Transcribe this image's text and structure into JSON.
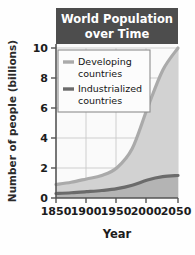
{
  "chart_data": {
    "type": "area",
    "title_line1": "World  Population",
    "title_line2": "over Time",
    "xlabel": "Year",
    "ylabel": "Number of people (billions)",
    "xlim": [
      1850,
      2050
    ],
    "ylim": [
      0,
      10
    ],
    "xticks": [
      "1850",
      "1900",
      "1950",
      "2000",
      "2050"
    ],
    "xtick_values": [
      1850,
      1900,
      1950,
      2000,
      2050
    ],
    "yticks": [
      "0",
      "2",
      "4",
      "6",
      "8",
      "10"
    ],
    "ytick_values": [
      0,
      2,
      4,
      6,
      8,
      10
    ],
    "grid": true,
    "stacked": true,
    "legend_position": "upper-left",
    "x": [
      1850,
      1875,
      1900,
      1925,
      1950,
      1975,
      2000,
      2025,
      2050
    ],
    "series": [
      {
        "name": "Industrialized countries",
        "legend_label_line1": "Industrialized",
        "legend_label_line2": "countries",
        "color": "#6b6b6b",
        "fill": "#b4b4b4",
        "values": [
          0.3,
          0.35,
          0.42,
          0.5,
          0.62,
          0.85,
          1.2,
          1.42,
          1.5
        ]
      },
      {
        "name": "Developing countries",
        "legend_label_line1": "Developing",
        "legend_label_line2": "countries",
        "color": "#aaaaaa",
        "fill": "#d2d2d2",
        "values": [
          0.6,
          0.7,
          0.85,
          1.0,
          1.4,
          2.45,
          4.8,
          7.1,
          8.5
        ]
      }
    ],
    "totals": [
      0.9,
      1.05,
      1.27,
      1.5,
      2.02,
      3.3,
      6.0,
      8.52,
      10.0
    ]
  },
  "colors": {
    "title_bar": "#4d4d4d",
    "title_text": "#ffffff",
    "axis": "#555555",
    "grid": "#c9c9c9",
    "plot_background": "#fafafa",
    "developing_fill": "#d2d2d2",
    "developing_line": "#aaaaaa",
    "industrialized_fill": "#b4b4b4",
    "industrialized_line": "#6b6b6b",
    "legend_background": "#fcfcfc",
    "legend_border": "#8c8c8c",
    "text": "#1c1c1c"
  }
}
